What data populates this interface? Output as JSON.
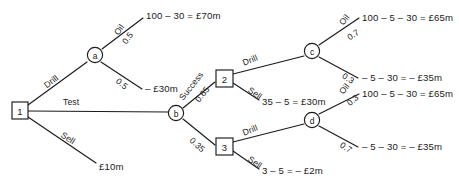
{
  "figure": {
    "name": "oil-exploration-decision-tree",
    "type": "decision-tree",
    "width": 459,
    "height": 186,
    "background_color": "#ffffff",
    "line_color": "#1a1a1a"
  },
  "nodes": {
    "n1": {
      "label": "1",
      "shape": "square",
      "x": 20,
      "y": 110
    },
    "na": {
      "label": "a",
      "shape": "circle",
      "x": 95,
      "y": 55
    },
    "nb": {
      "label": "b",
      "shape": "circle",
      "x": 176,
      "y": 113
    },
    "n2": {
      "label": "2",
      "shape": "square",
      "x": 224,
      "y": 78
    },
    "n3": {
      "label": "3",
      "shape": "square",
      "x": 224,
      "y": 146
    },
    "nc": {
      "label": "c",
      "shape": "circle",
      "x": 312,
      "y": 51
    },
    "nd": {
      "label": "d",
      "shape": "circle",
      "x": 312,
      "y": 120
    }
  },
  "edges": {
    "drill_root": {
      "label": "Drill",
      "x": 45,
      "y": 86,
      "rotate": -37
    },
    "test_root": {
      "label": "Test",
      "x": 63,
      "y": 102,
      "rotate": 0
    },
    "sell_root": {
      "label": "Sell",
      "x": 62,
      "y": 134,
      "rotate": 33
    },
    "a_oil": {
      "label": "Oil",
      "x": 116,
      "y": 34,
      "rotate": -55
    },
    "a_oil_prob": {
      "label": "0.5",
      "x": 124,
      "y": 43,
      "rotate": -55
    },
    "a_dry_prob": {
      "label": "0.5",
      "x": 117,
      "y": 80,
      "rotate": 38
    },
    "b_success": {
      "label": "Success",
      "x": 181,
      "y": 99,
      "rotate": -52
    },
    "b_success_prob": {
      "label": "0.65",
      "x": 197,
      "y": 101,
      "rotate": -52
    },
    "b_fail_prob": {
      "label": "0.35",
      "x": 191,
      "y": 139,
      "rotate": 42
    },
    "n2_drill": {
      "label": "Drill",
      "x": 243,
      "y": 63,
      "rotate": -22
    },
    "n2_sell": {
      "label": "Sell",
      "x": 249,
      "y": 89,
      "rotate": 34
    },
    "n3_drill": {
      "label": "Drill",
      "x": 243,
      "y": 133,
      "rotate": -22
    },
    "n3_sell": {
      "label": "Sell",
      "x": 249,
      "y": 158,
      "rotate": 34
    },
    "c_oil": {
      "label": "Oil",
      "x": 341,
      "y": 24,
      "rotate": -52
    },
    "c_oil_prob": {
      "label": "0.7",
      "x": 348,
      "y": 38,
      "rotate": -33
    },
    "c_dry_prob": {
      "label": "0.3",
      "x": 343,
      "y": 75,
      "rotate": 32
    },
    "d_oil": {
      "label": "Oil",
      "x": 341,
      "y": 93,
      "rotate": -52
    },
    "d_oil_prob": {
      "label": "0.3",
      "x": 348,
      "y": 104,
      "rotate": -40
    },
    "d_dry_prob": {
      "label": "0.7",
      "x": 341,
      "y": 144,
      "rotate": 34
    }
  },
  "payoffs": {
    "a_oil_payoff": {
      "text": "100 – 30 = £70m",
      "x": 146,
      "y": 15
    },
    "a_dry_payoff": {
      "text": "– £30m",
      "x": 145,
      "y": 88
    },
    "root_sell_payoff": {
      "text": "£10m",
      "x": 99,
      "y": 166
    },
    "n2_sell_payoff": {
      "text": "35 – 5 = £30m",
      "x": 262,
      "y": 101
    },
    "n3_sell_payoff": {
      "text": "3 – 5 = – £2m",
      "x": 262,
      "y": 170
    },
    "c_oil_payoff": {
      "text": "100 – 5 – 30 = £65m",
      "x": 362,
      "y": 17
    },
    "c_dry_payoff": {
      "text": "– 5 – 30 = – £35m",
      "x": 362,
      "y": 77
    },
    "d_oil_payoff": {
      "text": "100 – 5 – 30 = £65m",
      "x": 362,
      "y": 93
    },
    "d_dry_payoff": {
      "text": "– 5 – 30 = – £35m",
      "x": 362,
      "y": 146
    }
  }
}
